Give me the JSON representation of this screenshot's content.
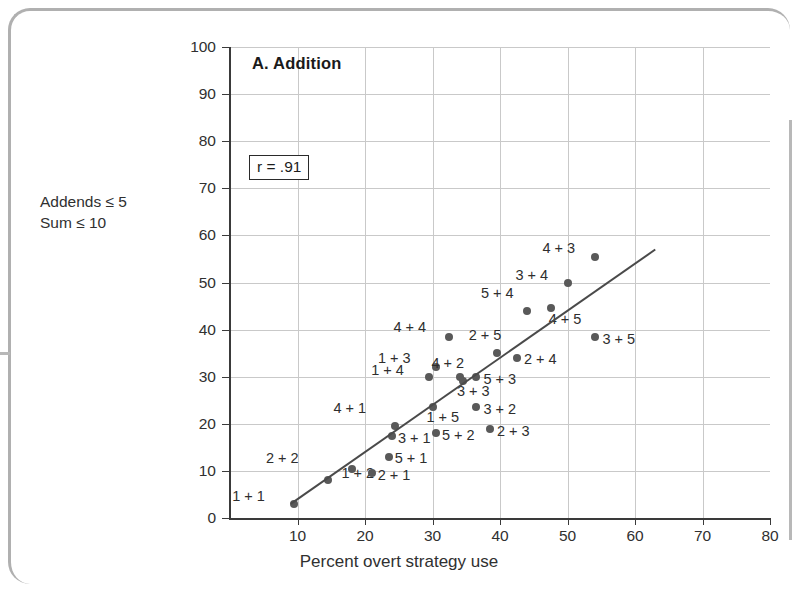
{
  "figure": {
    "panel_title": "A. Addition",
    "correlation_text": "r = .91",
    "side_note": "Addends ≤ 5\nSum ≤ 10"
  },
  "chart_data": {
    "type": "scatter",
    "title": "A. Addition",
    "xlabel": "Percent overt strategy use",
    "ylabel": "Percent errors",
    "xlim": [
      0,
      80
    ],
    "ylim": [
      0,
      100
    ],
    "xticks": [
      10,
      20,
      30,
      40,
      50,
      60,
      70,
      80
    ],
    "yticks": [
      0,
      10,
      20,
      30,
      40,
      50,
      60,
      70,
      80,
      90,
      100
    ],
    "grid": true,
    "legend": "none",
    "annotations": [
      "r = .91",
      "Addends ≤ 5",
      "Sum ≤ 10"
    ],
    "correlation": 0.91,
    "regression_line": {
      "x0": 9.0,
      "y0": 3.0,
      "x1": 63.0,
      "y1": 57.0
    },
    "points": [
      {
        "label": "1 + 1",
        "x": 9.5,
        "y": 3.0,
        "lx": -62,
        "ly": -8
      },
      {
        "label": "2 + 2",
        "x": 14.5,
        "y": 8.0,
        "lx": -62,
        "ly": -22
      },
      {
        "label": "1 + 2",
        "x": 18.0,
        "y": 10.5,
        "lx": -10,
        "ly": 4
      },
      {
        "label": "2 + 1",
        "x": 21.0,
        "y": 9.5,
        "lx": 6,
        "ly": 2
      },
      {
        "label": "5 + 1",
        "x": 23.5,
        "y": 13.0,
        "lx": 6,
        "ly": 1
      },
      {
        "label": "3 + 1",
        "x": 24.0,
        "y": 17.5,
        "lx": 6,
        "ly": 2
      },
      {
        "label": "4 + 1",
        "x": 24.5,
        "y": 19.5,
        "lx": -62,
        "ly": -18
      },
      {
        "label": "1 + 5",
        "x": 30.0,
        "y": 23.5,
        "lx": -6,
        "ly": 10
      },
      {
        "label": "5 + 2",
        "x": 30.5,
        "y": 18.0,
        "lx": 6,
        "ly": 2
      },
      {
        "label": "1 + 4",
        "x": 29.5,
        "y": 30.0,
        "lx": -58,
        "ly": -7
      },
      {
        "label": "1 + 3",
        "x": 30.5,
        "y": 32.0,
        "lx": -58,
        "ly": -9
      },
      {
        "label": "4 + 4",
        "x": 32.5,
        "y": 38.5,
        "lx": -56,
        "ly": -10
      },
      {
        "label": "4 + 2",
        "x": 34.0,
        "y": 30.0,
        "lx": -28,
        "ly": -14
      },
      {
        "label": "3 + 3",
        "x": 34.5,
        "y": 29.0,
        "lx": -6,
        "ly": 10
      },
      {
        "label": "3 + 2",
        "x": 36.5,
        "y": 23.5,
        "lx": 7,
        "ly": 2
      },
      {
        "label": "2 + 3",
        "x": 38.5,
        "y": 19.0,
        "lx": 7,
        "ly": 2
      },
      {
        "label": "5 + 3",
        "x": 36.5,
        "y": 30.0,
        "lx": 7,
        "ly": 2
      },
      {
        "label": "2 + 5",
        "x": 39.5,
        "y": 35.0,
        "lx": -28,
        "ly": -18
      },
      {
        "label": "2 + 4",
        "x": 42.5,
        "y": 34.0,
        "lx": 7,
        "ly": 1
      },
      {
        "label": "5 + 4",
        "x": 44.0,
        "y": 44.0,
        "lx": -46,
        "ly": -18
      },
      {
        "label": "4 + 5",
        "x": 47.5,
        "y": 44.5,
        "lx": -2,
        "ly": 11
      },
      {
        "label": "3 + 4",
        "x": 50.0,
        "y": 50.0,
        "lx": -52,
        "ly": -8
      },
      {
        "label": "4 + 3",
        "x": 54.0,
        "y": 55.5,
        "lx": -52,
        "ly": -9
      },
      {
        "label": "3 + 5",
        "x": 54.0,
        "y": 38.5,
        "lx": 8,
        "ly": 2
      }
    ]
  },
  "colors": {
    "dot": "#595959",
    "axis": "#3a3a3a",
    "grid": "#c9c9c9",
    "frame": "#b0b0b0",
    "text": "#2b2b2b"
  }
}
